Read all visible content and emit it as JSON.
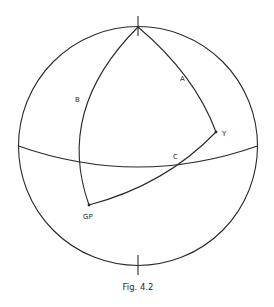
{
  "figure": {
    "caption": "Fig. 4.2",
    "labels": {
      "A": "A",
      "B": "B",
      "C": "C",
      "Y": "Y",
      "GP": "GP"
    }
  },
  "colors": {
    "line": "#2a2a2a",
    "background": "#ffffff"
  }
}
